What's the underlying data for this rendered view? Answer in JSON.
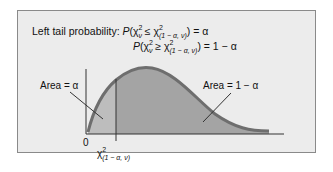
{
  "figure": {
    "title_line1_prefix": "Left tail probability: ",
    "title_line1_formula": "P(χ²ν ≤ χ²(1 − α, ν)) = α",
    "title_line2_formula": "P(χ²ν ≥ χ²(1 − α, ν)) = 1 − α",
    "left_area_label": "Area = α",
    "right_area_label": "Area = 1 − α",
    "origin_label": "0",
    "critical_value_label": "χ²(1 − α, ν)",
    "colors": {
      "panel_bg": "#ececec",
      "panel_border": "#8a8a8a",
      "left_fill": "#bdbdbd",
      "right_fill": "#a4a4a4",
      "curve": "#6e6e6e",
      "axis": "#333333"
    }
  },
  "parts": {
    "l1_P": "P",
    "l1_open": "(χ",
    "l1_sup1": "2",
    "l1_sub1": "ν",
    "l1_le": " ≤ χ",
    "l1_sup2": "2",
    "l1_sub2": "(1 − α, ν)",
    "l1_tail": ") = α",
    "l2_P": "P",
    "l2_open": "(χ",
    "l2_sup1": "2",
    "l2_sub1": "ν",
    "l2_ge": " ≥ χ",
    "l2_sup2": "2",
    "l2_sub2": "(1 − α, ν)",
    "l2_tail": ") = 1 − α",
    "crit_chi": "χ",
    "crit_sup": "2",
    "crit_sub": "(1 − α, ν)"
  }
}
